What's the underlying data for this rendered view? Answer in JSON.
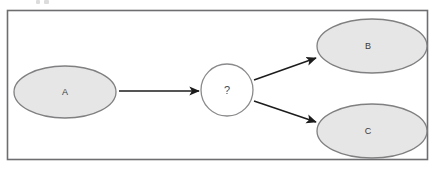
{
  "diagram": {
    "type": "flow-diagram",
    "frame": {
      "x": 7,
      "y": 10,
      "width": 421,
      "height": 150,
      "border_color": "#6e6e70",
      "fill": "#ffffff"
    },
    "palette": {
      "node_fill": "#e6e6e6",
      "node_stroke": "#808082",
      "unknown_fill": "#ffffff",
      "unknown_stroke": "#8a8a8c",
      "arrow_color": "#1c1c1c",
      "label_color": "#3a3a3a",
      "background": "#ffffff"
    },
    "nodes": [
      {
        "id": "A",
        "label": "A",
        "shape": "ellipse",
        "cx": 65,
        "cy": 92,
        "rx": 51,
        "ry": 26,
        "fill": "#e6e6e6",
        "stroke": "#808082"
      },
      {
        "id": "unknown",
        "label": "?",
        "shape": "circle",
        "cx": 227,
        "cy": 90,
        "rx": 26,
        "ry": 26,
        "fill": "#ffffff",
        "stroke": "#8a8a8c"
      },
      {
        "id": "B",
        "label": "B",
        "shape": "ellipse",
        "cx": 372,
        "cy": 46,
        "rx": 55,
        "ry": 27,
        "fill": "#e6e6e6",
        "stroke": "#808082"
      },
      {
        "id": "C",
        "label": "C",
        "shape": "ellipse",
        "cx": 372,
        "cy": 131,
        "rx": 55,
        "ry": 27,
        "fill": "#e6e6e6",
        "stroke": "#808082"
      }
    ],
    "edges": [
      {
        "id": "a-to-unknown",
        "from": "A",
        "to": "unknown",
        "x1": 119,
        "y1": 91,
        "x2": 199,
        "y2": 91,
        "arrowhead": "solid-triangle",
        "direction": "right"
      },
      {
        "id": "unknown-to-b",
        "from": "unknown",
        "to": "B",
        "x1": 254,
        "y1": 80,
        "x2": 316,
        "y2": 58,
        "arrowhead": "solid-triangle",
        "direction": "up-right"
      },
      {
        "id": "unknown-to-c",
        "from": "unknown",
        "to": "C",
        "x1": 254,
        "y1": 101,
        "x2": 316,
        "y2": 122,
        "arrowhead": "solid-triangle",
        "direction": "down-right"
      }
    ],
    "artifacts": [
      {
        "id": "scan-mark-1",
        "x": 36,
        "y": 0,
        "width": 4,
        "height": 4
      },
      {
        "id": "scan-mark-2",
        "x": 44,
        "y": 0,
        "width": 5,
        "height": 4
      }
    ]
  }
}
